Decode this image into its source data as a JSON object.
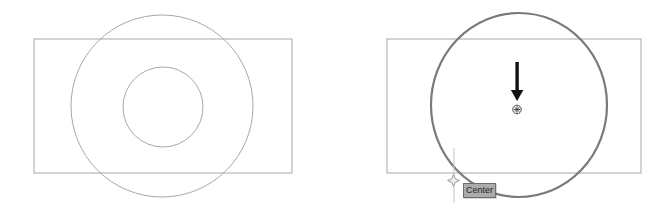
{
  "tooltip": {
    "label": "Center"
  },
  "icons": [
    "down-arrow-icon",
    "center-snap-marker-icon",
    "cursor-star-icon"
  ],
  "colors": {
    "canvas-bg": "#ffffff",
    "entity-line": "#a8a8a8",
    "highlight-line": "#7a7a7a",
    "arrow-black": "#111111",
    "marker-dark": "#3a3a3a",
    "crosshair-gray": "#c4c4c4",
    "cursor-gray": "#9a9a9a",
    "cursor-fill": "#ededed",
    "tooltip-bg": "#ababab",
    "tooltip-border": "#6e6e6e",
    "tooltip-text": "#262626"
  }
}
